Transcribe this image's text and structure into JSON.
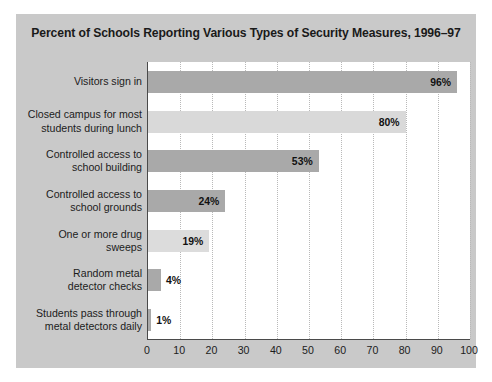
{
  "chart_data": {
    "type": "bar",
    "orientation": "horizontal",
    "title": "Percent of Schools Reporting Various Types of Security Measures, 1996–97",
    "xlabel": "",
    "ylabel": "",
    "xlim": [
      0,
      100
    ],
    "xticks": [
      "0",
      "10",
      "20",
      "30",
      "40",
      "50",
      "60",
      "70",
      "80",
      "90",
      "100"
    ],
    "xtick_values": [
      0,
      10,
      20,
      30,
      40,
      50,
      60,
      70,
      80,
      90,
      100
    ],
    "grid": "vertical-dotted",
    "legend": "none",
    "categories": [
      "Visitors sign in",
      "Closed campus for most students during lunch",
      "Controlled access to school building",
      "Controlled access to school grounds",
      "One or more drug sweeps",
      "Random metal detector checks",
      "Students pass through metal detectors daily"
    ],
    "values": [
      96,
      80,
      53,
      24,
      19,
      4,
      1
    ],
    "value_labels": [
      "96%",
      "80%",
      "53%",
      "24%",
      "19%",
      "4%",
      "1%"
    ],
    "bar_colors": [
      "#a9a9a9",
      "#d9d9d9",
      "#a9a9a9",
      "#a9a9a9",
      "#dcdcdc",
      "#a9a9a9",
      "#a9a9a9"
    ]
  },
  "categories_lines": [
    [
      "Visitors sign in"
    ],
    [
      "Closed campus for most",
      "students during lunch"
    ],
    [
      "Controlled access to",
      "school building"
    ],
    [
      "Controlled access to",
      "school grounds"
    ],
    [
      "One or more drug",
      "sweeps"
    ],
    [
      "Random metal",
      "detector checks"
    ],
    [
      "Students pass through",
      "metal detectors daily"
    ]
  ],
  "colors": {
    "panel_background": "#c9c9c9",
    "plot_background": "#ffffff",
    "axis": "#4a4a4a",
    "gridline": "#b9b9b9",
    "text": "#1c1c1c",
    "bar_dark": "#a9a9a9",
    "bar_light": "#d9d9d9"
  }
}
